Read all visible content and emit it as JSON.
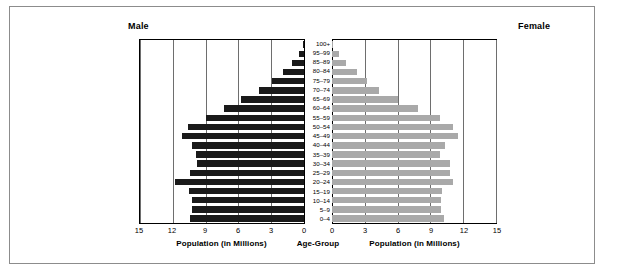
{
  "header": {
    "male_label": "Male",
    "female_label": "Female"
  },
  "captions": {
    "left": "Population (in Millions)",
    "center": "Age-Group",
    "right": "Population (in Millions)"
  },
  "axis": {
    "left_ticks": [
      "15",
      "12",
      "9",
      "6",
      "3",
      "0"
    ],
    "right_ticks": [
      "0",
      "3",
      "6",
      "9",
      "12",
      "15"
    ]
  },
  "chart_data": {
    "type": "bar",
    "subtype": "population-pyramid",
    "title": "",
    "xlabel": "Population (in Millions)",
    "ylabel": "Age-Group",
    "xlim": [
      0,
      15
    ],
    "grid": true,
    "legend": [
      "Male",
      "Female"
    ],
    "colors": {
      "male": "#1a1a1a",
      "female": "#a9a9a9",
      "gridline": "#6e6e6e",
      "frame": "#8c8c8c",
      "axis": "#000000"
    },
    "categories": [
      "100+",
      "95–99",
      "85–89",
      "80–84",
      "75–79",
      "70–74",
      "65–69",
      "60–64",
      "55–59",
      "50–54",
      "45–49",
      "40–44",
      "35–39",
      "30–34",
      "25–29",
      "20–24",
      "15–19",
      "10–14",
      "5–9",
      "0–4"
    ],
    "series": [
      {
        "name": "Male",
        "side": "left",
        "values": [
          0.05,
          0.5,
          1.1,
          1.9,
          2.9,
          4.1,
          5.8,
          7.3,
          9.0,
          10.6,
          11.2,
          10.2,
          9.9,
          9.8,
          10.4,
          11.8,
          10.5,
          10.2,
          10.2,
          10.4
        ]
      },
      {
        "name": "Female",
        "side": "right",
        "values": [
          0.08,
          0.6,
          1.3,
          2.3,
          3.2,
          4.3,
          6.0,
          7.9,
          9.9,
          11.1,
          11.5,
          10.3,
          9.9,
          10.8,
          10.8,
          11.1,
          10.1,
          10.0,
          10.0,
          10.2
        ]
      }
    ]
  }
}
